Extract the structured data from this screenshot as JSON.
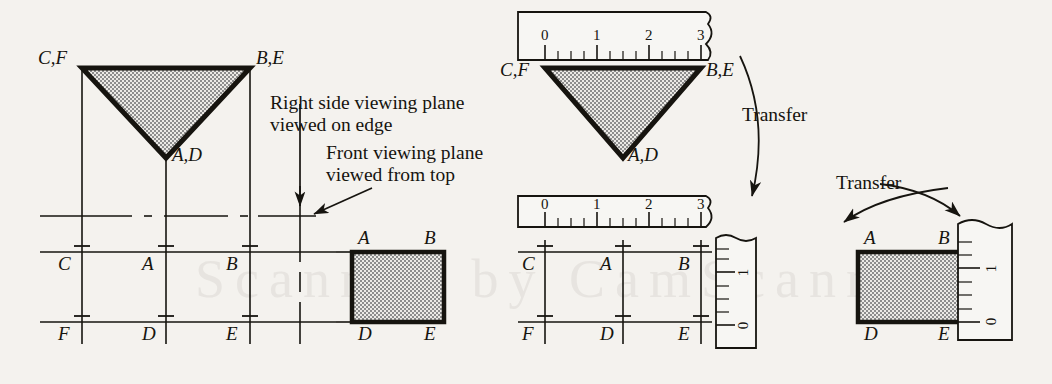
{
  "figure": {
    "background_color": "#f4f2ee",
    "ink_color": "#16140f",
    "fill_color": "#c9c9c9",
    "watermark_text": "Scanned by CamScanner"
  },
  "annotations": {
    "right_side_plane_line1": "Right side viewing plane",
    "right_side_plane_line2": "viewed on edge",
    "front_plane_line1": "Front viewing plane",
    "front_plane_line2": "viewed from  top",
    "transfer_upper": "Transfer",
    "transfer_lower": "Transfer"
  },
  "left_view": {
    "triangle_labels": {
      "top_left": "C,F",
      "top_right": "B,E",
      "bottom": "A,D"
    },
    "grid_labels_top_row": [
      "C",
      "A",
      "B"
    ],
    "grid_labels_bottom_row": [
      "F",
      "D",
      "E"
    ],
    "rect_labels": {
      "top_left": "A",
      "top_right": "B",
      "bottom_left": "D",
      "bottom_right": "E"
    }
  },
  "middle_view": {
    "triangle_labels": {
      "top_left": "C,F",
      "top_right": "B,E",
      "bottom": "A,D"
    },
    "grid_labels_top_row": [
      "C",
      "A",
      "B"
    ],
    "grid_labels_bottom_row": [
      "F",
      "D",
      "E"
    ],
    "ruler_top": {
      "ticks": [
        "0",
        "1",
        "2",
        "3"
      ],
      "minor_divisions_per_unit": 4,
      "orientation": "horizontal"
    },
    "ruler_mid": {
      "ticks": [
        "0",
        "1",
        "2",
        "3"
      ],
      "minor_divisions_per_unit": 4,
      "orientation": "horizontal"
    },
    "ruler_vertical": {
      "ticks": [
        "0",
        "1"
      ],
      "orientation": "vertical"
    }
  },
  "right_view": {
    "rect_labels": {
      "top_left": "A",
      "top_right": "B",
      "bottom_left": "D",
      "bottom_right": "E"
    },
    "ruler_vertical": {
      "ticks": [
        "0",
        "1"
      ],
      "orientation": "vertical"
    }
  }
}
